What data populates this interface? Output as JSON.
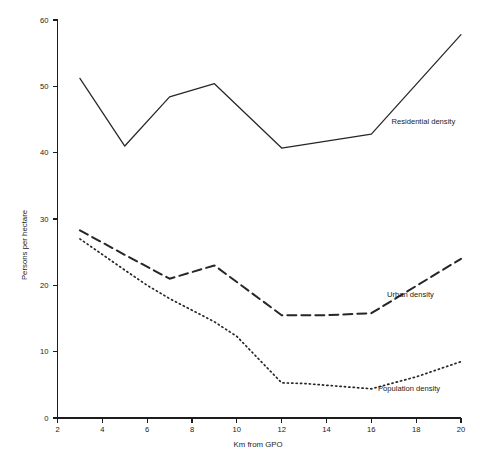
{
  "chart_data": {
    "type": "line",
    "title": "",
    "subtitle": "",
    "xlabel": "Km from GPO",
    "ylabel": "Persons per hectare",
    "xlim": [
      2,
      20
    ],
    "ylim": [
      0,
      60
    ],
    "xticks": [
      2,
      4,
      6,
      8,
      10,
      12,
      14,
      16,
      18,
      20
    ],
    "yticks": [
      0,
      10,
      20,
      30,
      40,
      50,
      60
    ],
    "xtick_labels": [
      "2",
      "4",
      "6",
      "8",
      "10",
      "12",
      "14",
      "16",
      "18",
      "20"
    ],
    "ytick_labels": [
      "0",
      "10",
      "20",
      "30",
      "40",
      "50",
      "60"
    ],
    "grid": false,
    "legend_position": "inline-annotations",
    "series": [
      {
        "name": "Residential density",
        "style": "solid",
        "label_x": 16.9,
        "label_y": 44.3,
        "x": [
          3,
          5,
          7,
          9,
          12,
          16,
          20
        ],
        "values": [
          51.2,
          41.0,
          48.4,
          50.4,
          40.7,
          42.8,
          57.8
        ]
      },
      {
        "name": "Urban density",
        "style": "dashed",
        "label_x": 16.7,
        "label_y": 18.2,
        "x": [
          3,
          5,
          7,
          9,
          12,
          14,
          16,
          20
        ],
        "values": [
          28.3,
          24.6,
          21.0,
          23.0,
          15.5,
          15.5,
          15.8,
          24.0
        ]
      },
      {
        "name": "Population density",
        "style": "dotted",
        "label_x": 16.3,
        "label_y": 4.0,
        "x": [
          3,
          5,
          6,
          7,
          9,
          10,
          12,
          13,
          16,
          18,
          20
        ],
        "values": [
          27.0,
          22.3,
          20.0,
          18.0,
          14.5,
          12.3,
          5.3,
          5.2,
          4.4,
          6.2,
          8.5
        ]
      }
    ]
  }
}
